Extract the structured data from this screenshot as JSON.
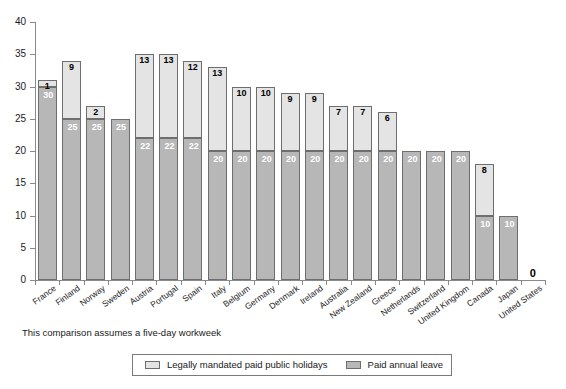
{
  "chart_data": {
    "type": "bar",
    "stacked": true,
    "title": "",
    "subtitle": "",
    "xlabel": "",
    "ylabel": "",
    "ylim": [
      0,
      40
    ],
    "ytick_step": 5,
    "yticks": [
      "40",
      "35",
      "30",
      "25",
      "20",
      "15",
      "10",
      "5",
      "0"
    ],
    "grid": false,
    "legend_position": "bottom-center",
    "categories": [
      "France",
      "Finland",
      "Norway",
      "Sweden",
      "Austria",
      "Portugal",
      "Spain",
      "Italy",
      "Belgium",
      "Germany",
      "Denmark",
      "Ireland",
      "Australia",
      "New Zealand",
      "Greece",
      "Netherlands",
      "Switzerland",
      "United Kingdom",
      "Canada",
      "Japan",
      "United States"
    ],
    "series": [
      {
        "name": "Paid annual leave",
        "color": "#b7b7b7",
        "values": [
          30,
          25,
          25,
          25,
          22,
          22,
          22,
          20,
          20,
          20,
          20,
          20,
          20,
          20,
          20,
          20,
          20,
          20,
          10,
          10,
          0
        ],
        "labels": [
          "30",
          "25",
          "25",
          "25",
          "22",
          "22",
          "22",
          "20",
          "20",
          "20",
          "20",
          "20",
          "20",
          "20",
          "20",
          "20",
          "20",
          "20",
          "10",
          "10",
          ""
        ]
      },
      {
        "name": "Legally mandated paid public holidays",
        "color": "#e4e4e4",
        "values": [
          1,
          9,
          2,
          0,
          13,
          13,
          12,
          13,
          10,
          10,
          9,
          9,
          7,
          7,
          6,
          0,
          0,
          0,
          8,
          0,
          0
        ],
        "labels": [
          "1",
          "9",
          "2",
          "",
          "13",
          "13",
          "12",
          "13",
          "10",
          "10",
          "9",
          "9",
          "7",
          "7",
          "6",
          "",
          "",
          "",
          "8",
          "",
          ""
        ]
      }
    ],
    "totals": [
      31,
      34,
      27,
      25,
      35,
      35,
      34,
      33,
      30,
      30,
      29,
      29,
      27,
      27,
      26,
      20,
      20,
      20,
      18,
      10,
      0
    ],
    "zero_annotation": {
      "category": "United States",
      "label": "0"
    }
  },
  "caption": {
    "text": "This comparison assumes a five-day workweek"
  },
  "legend": {
    "items": [
      {
        "label": "Legally mandated paid public holidays",
        "swatch": "public"
      },
      {
        "label": "Paid annual leave",
        "swatch": "annual"
      }
    ]
  }
}
